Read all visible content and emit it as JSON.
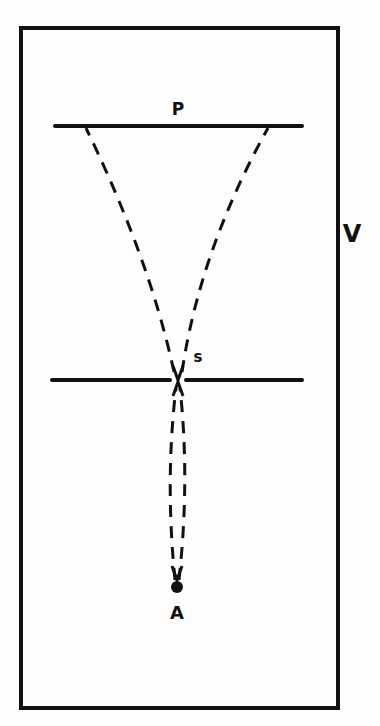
{
  "diagram": {
    "type": "ray-diagram",
    "colors": {
      "background": "#fdfdfd",
      "ink": "#111111"
    },
    "labels": {
      "plate": "P",
      "slit": "S",
      "source": "A",
      "vessel": "V"
    },
    "elements": {
      "enclosure": {
        "x": 21,
        "y": 28,
        "width": 317,
        "height": 680
      },
      "plate_line": {
        "x1": 55,
        "x2": 302,
        "y": 126
      },
      "slit_line": {
        "left_x1": 52,
        "left_x2": 170,
        "right_x1": 186,
        "right_x2": 302,
        "y": 380
      },
      "source_point": {
        "x": 177,
        "y": 587
      },
      "slit_point": {
        "x": 178,
        "y": 380
      }
    }
  }
}
